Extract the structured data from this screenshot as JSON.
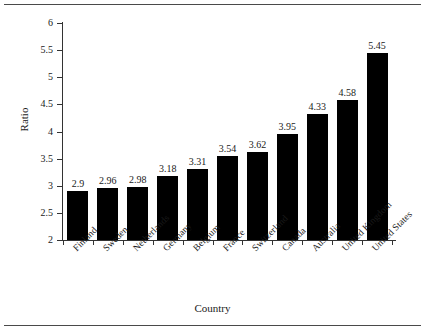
{
  "figure": {
    "background_color": "#ffffff",
    "rule_color": "#4a4a4a",
    "bar_color": "#000000",
    "axis_color": "#333333",
    "text_color": "#1a1a1a"
  },
  "chart_data": {
    "type": "bar",
    "title": "",
    "xlabel": "Country",
    "ylabel": "Ratio",
    "categories": [
      "Finland",
      "Sweden",
      "Netherlands",
      "Germany",
      "Belgium",
      "France",
      "Switzerland",
      "Canada",
      "Australia",
      "United Kingdom",
      "United States"
    ],
    "values": [
      2.9,
      2.96,
      2.98,
      3.18,
      3.31,
      3.54,
      3.62,
      3.95,
      4.33,
      4.58,
      5.45
    ],
    "data_labels": [
      "2.9",
      "2.96",
      "2.98",
      "3.18",
      "3.31",
      "3.54",
      "3.62",
      "3.95",
      "4.33",
      "4.58",
      "5.45"
    ],
    "ylim": [
      2,
      6
    ],
    "ytick_labels": [
      "2",
      "2.5",
      "3",
      "3.5",
      "4",
      "4.5",
      "5",
      "5.5",
      "6"
    ],
    "ytick_values": [
      2,
      2.5,
      3,
      3.5,
      4,
      4.5,
      5,
      5.5,
      6
    ],
    "grid": false,
    "legend": null,
    "label_rotation_deg": -45
  }
}
